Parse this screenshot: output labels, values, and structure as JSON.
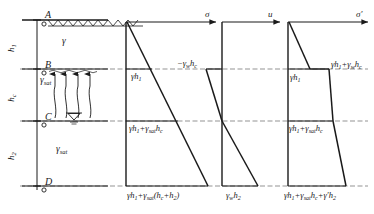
{
  "figure": {
    "type": "geotechnical-stress-distribution-diagram"
  },
  "colors": {
    "line": "#1a1a1a",
    "dashed": "#555555",
    "background": "#ffffff"
  },
  "soil_profile": {
    "points": [
      {
        "id": "A",
        "label": "A",
        "note": "ground-surface"
      },
      {
        "id": "B",
        "label": "B",
        "note": "top-of-capillary-zone"
      },
      {
        "id": "C",
        "label": "C",
        "note": "water-table"
      },
      {
        "id": "D",
        "label": "D",
        "note": "base"
      }
    ],
    "layer_heights": [
      {
        "label": "h₁",
        "base": "h",
        "sub": "1"
      },
      {
        "label": "hc",
        "base": "h",
        "sub": "c"
      },
      {
        "label": "h₂",
        "base": "h",
        "sub": "2"
      }
    ],
    "unit_weights": [
      {
        "label": "γ",
        "base": "γ",
        "sub": "",
        "zone": "above-capillary"
      },
      {
        "label": "γsat",
        "base": "γ",
        "sub": "sat",
        "zone": "capillary"
      },
      {
        "label": "γsat",
        "base": "γ",
        "sub": "sat",
        "zone": "below-water-table"
      }
    ],
    "water_table_symbol": "▽",
    "ground_hatch": "sawtooth"
  },
  "diagrams": [
    {
      "id": "sigma",
      "axis_label": "σ",
      "axis_label_base": "σ",
      "axis_label_prime": "",
      "labels": [
        {
          "text": "γh₁",
          "parts": [
            {
              "t": "γ",
              "i": true
            },
            {
              "t": "h",
              "i": true
            },
            {
              "t": "1",
              "sub": true
            }
          ],
          "at": "B"
        },
        {
          "text": "γh₁+γsathc",
          "parts": [
            {
              "t": "γ",
              "i": true
            },
            {
              "t": "h",
              "i": true
            },
            {
              "t": "1",
              "sub": true
            },
            {
              "t": "+"
            },
            {
              "t": "γ",
              "i": true
            },
            {
              "t": "sat",
              "sub": true
            },
            {
              "t": "h",
              "i": true
            },
            {
              "t": "c",
              "sub": true
            }
          ],
          "at": "C"
        },
        {
          "text": "γh₁+γsat(hc+h₂)",
          "parts": [
            {
              "t": "γ",
              "i": true
            },
            {
              "t": "h",
              "i": true
            },
            {
              "t": "1",
              "sub": true
            },
            {
              "t": "+"
            },
            {
              "t": "γ",
              "i": true
            },
            {
              "t": "sat",
              "sub": true
            },
            {
              "t": "("
            },
            {
              "t": "h",
              "i": true
            },
            {
              "t": "c",
              "sub": true
            },
            {
              "t": "+"
            },
            {
              "t": "h",
              "i": true
            },
            {
              "t": "2",
              "sub": true
            },
            {
              "t": ")"
            }
          ],
          "at": "D"
        }
      ]
    },
    {
      "id": "u",
      "axis_label": "u",
      "axis_label_base": "u",
      "axis_label_prime": "",
      "labels": [
        {
          "text": "−γwhc",
          "parts": [
            {
              "t": "−"
            },
            {
              "t": "γ",
              "i": true
            },
            {
              "t": "w",
              "sub": true
            },
            {
              "t": "h",
              "i": true
            },
            {
              "t": "c",
              "sub": true
            }
          ],
          "at": "B"
        },
        {
          "text": "γwh₂",
          "parts": [
            {
              "t": "γ",
              "i": true
            },
            {
              "t": "w",
              "sub": true
            },
            {
              "t": "h",
              "i": true
            },
            {
              "t": "2",
              "sub": true
            }
          ],
          "at": "D"
        }
      ]
    },
    {
      "id": "sigma-prime",
      "axis_label": "σ′",
      "axis_label_base": "σ",
      "axis_label_prime": "′",
      "labels": [
        {
          "text": "γh₁",
          "parts": [
            {
              "t": "γ",
              "i": true
            },
            {
              "t": "h",
              "i": true
            },
            {
              "t": "1",
              "sub": true
            }
          ],
          "at": "B-left"
        },
        {
          "text": "γh₁+γwhc",
          "parts": [
            {
              "t": "γ",
              "i": true
            },
            {
              "t": "h",
              "i": true
            },
            {
              "t": "1",
              "sub": true
            },
            {
              "t": "+"
            },
            {
              "t": "γ",
              "i": true
            },
            {
              "t": "w",
              "sub": true
            },
            {
              "t": "h",
              "i": true
            },
            {
              "t": "c",
              "sub": true
            }
          ],
          "at": "B-right"
        },
        {
          "text": "γh₁+γsathc",
          "parts": [
            {
              "t": "γ",
              "i": true
            },
            {
              "t": "h",
              "i": true
            },
            {
              "t": "1",
              "sub": true
            },
            {
              "t": "+"
            },
            {
              "t": "γ",
              "i": true
            },
            {
              "t": "sat",
              "sub": true
            },
            {
              "t": "h",
              "i": true
            },
            {
              "t": "c",
              "sub": true
            }
          ],
          "at": "C"
        },
        {
          "text": "γh₁+γsathc+γ′h₂",
          "parts": [
            {
              "t": "γ",
              "i": true
            },
            {
              "t": "h",
              "i": true
            },
            {
              "t": "1",
              "sub": true
            },
            {
              "t": "+"
            },
            {
              "t": "γ",
              "i": true
            },
            {
              "t": "sat",
              "sub": true
            },
            {
              "t": "h",
              "i": true
            },
            {
              "t": "c",
              "sub": true
            },
            {
              "t": "+"
            },
            {
              "t": "γ′",
              "i": true
            },
            {
              "t": "h",
              "i": true
            },
            {
              "t": "2",
              "sub": true
            }
          ],
          "at": "D"
        }
      ]
    }
  ],
  "geometry": {
    "y_A": 20,
    "y_B": 69,
    "y_C": 121,
    "y_D": 186,
    "capillary_arrows": 4
  }
}
